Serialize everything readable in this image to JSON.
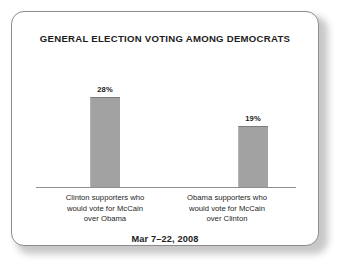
{
  "card": {
    "title": "GENERAL ELECTION VOTING AMONG DEMOCRATS",
    "footer_date": "Mar 7–22, 2008",
    "border_color": "#8d8d8d",
    "background_color": "#ffffff"
  },
  "chart_data": {
    "type": "bar",
    "title": "GENERAL ELECTION VOTING AMONG DEMOCRATS",
    "subtitle": "Mar 7–22, 2008",
    "xlabel": "",
    "ylabel": "",
    "ylim": [
      0,
      35
    ],
    "grid": false,
    "legend": "none",
    "bar_color": "#a2a2a2",
    "categories": [
      "Clinton supporters who would vote for McCain over Obama",
      "Obama supporters who would vote for McCain over Clinton"
    ],
    "category_lines": [
      [
        "Clinton supporters who",
        "would vote for McCain",
        "over Obama"
      ],
      [
        "Obama supporters who",
        "would vote for McCain",
        "over Clinton"
      ]
    ],
    "values": [
      28,
      19
    ],
    "value_labels": [
      "28%",
      "19%"
    ]
  }
}
